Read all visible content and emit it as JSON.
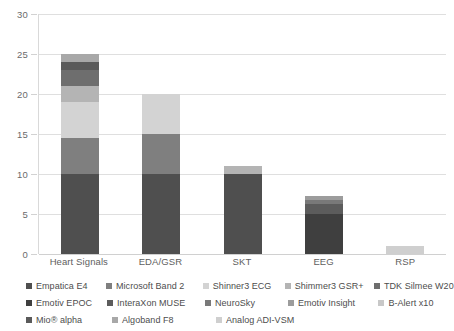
{
  "chart_data": {
    "type": "bar",
    "subtype": "stacked-bar",
    "title": "",
    "xlabel": "",
    "ylabel": "",
    "categories": [
      "Heart Signals",
      "EDA/GSR",
      "SKT",
      "EEG",
      "RSP"
    ],
    "ylim": [
      0,
      30
    ],
    "yticks": [
      0,
      5,
      10,
      15,
      20,
      25,
      30
    ],
    "grid": true,
    "legend_position": "bottom",
    "series": [
      {
        "name": "Empatica E4",
        "color": "#4f4f4f",
        "values": [
          10,
          10,
          10,
          0,
          0
        ]
      },
      {
        "name": "Microsoft Band 2",
        "color": "#7f7f7f",
        "values": [
          4.5,
          5,
          0,
          0,
          0
        ]
      },
      {
        "name": "Shinner3  ECG",
        "color": "#d3d3d3",
        "values": [
          4.5,
          5,
          0,
          0,
          0
        ]
      },
      {
        "name": "Shimmer3 GSR+",
        "color": "#b4b4b4",
        "values": [
          2,
          0,
          1,
          0,
          0
        ]
      },
      {
        "name": "TDK Silmee W20",
        "color": "#6e6e6e",
        "values": [
          2,
          0,
          0,
          0,
          0
        ]
      },
      {
        "name": "Emotiv EPOC",
        "color": "#3f3f3f",
        "values": [
          0,
          0,
          0,
          5,
          0
        ]
      },
      {
        "name": "InteraXon MUSE",
        "color": "#5c5c5c",
        "values": [
          0,
          0,
          0,
          1.2,
          0
        ]
      },
      {
        "name": "NeuroSky",
        "color": "#797979",
        "values": [
          0,
          0,
          0,
          0.6,
          0
        ]
      },
      {
        "name": "Emotiv Insight",
        "color": "#9c9c9c",
        "values": [
          0,
          0,
          0,
          0.5,
          0
        ]
      },
      {
        "name": "B-Alert x10",
        "color": "#c8c8c8",
        "values": [
          0,
          0,
          0,
          0,
          0
        ]
      },
      {
        "name": "Mio® alpha",
        "color": "#5a5a5a",
        "values": [
          1,
          0,
          0,
          0,
          0
        ]
      },
      {
        "name": "Algoband F8",
        "color": "#a8a8a8",
        "values": [
          1,
          0,
          0,
          0,
          0
        ]
      },
      {
        "name": "Analog ADI-VSM",
        "color": "#cfcfcf",
        "values": [
          0,
          0,
          0,
          0,
          1
        ]
      }
    ],
    "totals": [
      25,
      20,
      11,
      7.3,
      1
    ]
  },
  "axis": {
    "y_tick_labels": [
      "0",
      "5",
      "10",
      "15",
      "20",
      "25",
      "30"
    ],
    "x_tick_labels": [
      "Heart Signals",
      "EDA/GSR",
      "SKT",
      "EEG",
      "RSP"
    ]
  },
  "legend": {
    "rows": [
      [
        "Empatica E4",
        "Microsoft Band 2",
        "Shinner3  ECG",
        "Shimmer3 GSR+",
        "TDK Silmee W20"
      ],
      [
        "Emotiv EPOC",
        "InteraXon MUSE",
        "NeuroSky",
        "Emotiv Insight",
        "B-Alert x10"
      ],
      [
        "Mio® alpha",
        "Algoband F8",
        "Analog ADI-VSM"
      ]
    ]
  },
  "colors": {
    "grid": "#dfdfdf",
    "axis_text": "#6b6b6b",
    "background": "#ffffff"
  }
}
